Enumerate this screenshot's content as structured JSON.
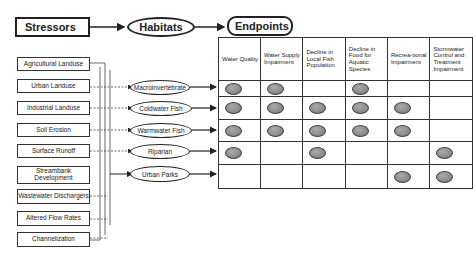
{
  "flow": {
    "stressors": "Stressors",
    "habitats": "Habitats",
    "endpoints": "Endpoints"
  },
  "stressors": [
    "Agricultural Landuse",
    "Urban Landuse",
    "Industrial Landuse",
    "Soil Erosion",
    "Surface Runoff",
    "Streambank Development",
    "Wastewater Dischargers",
    "Altered Flow Rates",
    "Channelization"
  ],
  "habitats": [
    "Macroinvertebrate",
    "Coldwater Fish",
    "Warmwater Fish",
    "Riparian",
    "Urban Parks"
  ],
  "endpoints": [
    "Water Quality",
    "Water Supply Impairment",
    "Decline in Local Fish Population",
    "Decline in Food for Aquatic Species",
    "Recrea-tional Impairment",
    "Stormwater Control and Treatment Impairment"
  ],
  "matrix": [
    [
      1,
      1,
      0,
      1,
      0,
      0
    ],
    [
      1,
      1,
      1,
      1,
      1,
      0
    ],
    [
      1,
      1,
      1,
      1,
      1,
      0
    ],
    [
      1,
      0,
      1,
      0,
      0,
      1
    ],
    [
      0,
      0,
      0,
      0,
      1,
      1
    ]
  ]
}
